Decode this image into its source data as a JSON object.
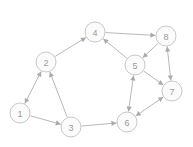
{
  "figure": {
    "width": 193,
    "height": 147,
    "background_color": "#ffffff"
  },
  "style": {
    "node_fill": "#fbfbfb",
    "node_stroke": "#c2c2c2",
    "node_radius": 10,
    "node_label_color": "#9a9a9a",
    "edge_color": "#b0b0b0",
    "arrow_color": "#aaaaaa"
  },
  "chart_data": {
    "type": "diagram",
    "diagram_type": "directed-graph",
    "title": "",
    "xlabel": "",
    "ylabel": "",
    "grid": false,
    "legend": null,
    "node_count": 8,
    "edge_count": 12,
    "nodes": [
      {
        "id": "1",
        "label": "1",
        "x": 20,
        "y": 113
      },
      {
        "id": "2",
        "label": "2",
        "x": 46,
        "y": 62
      },
      {
        "id": "3",
        "label": "3",
        "x": 71,
        "y": 127
      },
      {
        "id": "4",
        "label": "4",
        "x": 95,
        "y": 32
      },
      {
        "id": "5",
        "label": "5",
        "x": 135,
        "y": 65
      },
      {
        "id": "6",
        "label": "6",
        "x": 127,
        "y": 122
      },
      {
        "id": "7",
        "label": "7",
        "x": 172,
        "y": 91
      },
      {
        "id": "8",
        "label": "8",
        "x": 166,
        "y": 36
      }
    ],
    "edges": [
      {
        "source": "1",
        "target": "2",
        "directed": true,
        "bidirectional": true
      },
      {
        "source": "1",
        "target": "3",
        "directed": true,
        "bidirectional": false
      },
      {
        "source": "3",
        "target": "2",
        "directed": true,
        "bidirectional": false
      },
      {
        "source": "2",
        "target": "4",
        "directed": true,
        "bidirectional": false
      },
      {
        "source": "3",
        "target": "6",
        "directed": true,
        "bidirectional": false
      },
      {
        "source": "4",
        "target": "8",
        "directed": true,
        "bidirectional": false
      },
      {
        "source": "5",
        "target": "4",
        "directed": true,
        "bidirectional": false
      },
      {
        "source": "8",
        "target": "5",
        "directed": true,
        "bidirectional": false
      },
      {
        "source": "5",
        "target": "7",
        "directed": true,
        "bidirectional": false
      },
      {
        "source": "5",
        "target": "6",
        "directed": true,
        "bidirectional": true
      },
      {
        "source": "6",
        "target": "7",
        "directed": true,
        "bidirectional": true
      },
      {
        "source": "7",
        "target": "8",
        "directed": true,
        "bidirectional": true
      }
    ]
  }
}
